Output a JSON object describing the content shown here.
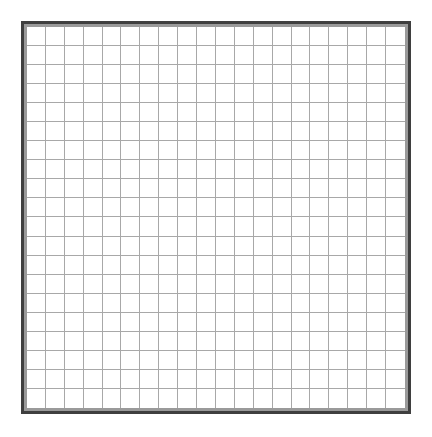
{
  "grid": {
    "rows": 20,
    "columns": 20,
    "line_color": "#a8a8a8",
    "background_color": "#ffffff"
  },
  "frame": {
    "outer_border_color": "#3f3f3f",
    "inner_border_color": "#9a9a9a"
  }
}
